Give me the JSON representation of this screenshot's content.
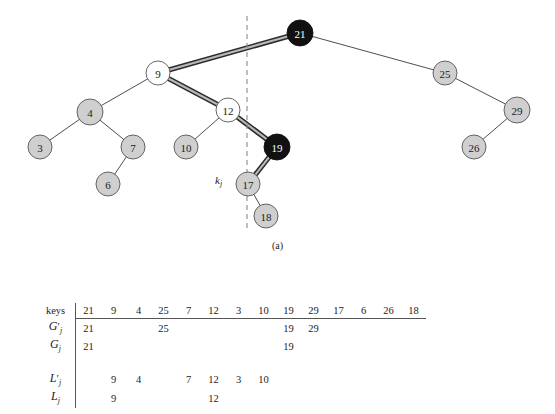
{
  "figure": {
    "caption": "(a)",
    "pointer_label": "k",
    "pointer_label_sub": "j",
    "colors": {
      "node_gray": "#cfcfcf",
      "node_white": "#ffffff",
      "node_black": "#111111",
      "edge": "#3a3a3a",
      "highlight": "#6e6e6e",
      "divider": "#8a8a8a"
    },
    "nodes": [
      {
        "key": "21",
        "x": 300,
        "y": 33,
        "fill": "black",
        "r": 13
      },
      {
        "key": "9",
        "x": 158,
        "y": 73,
        "fill": "white",
        "r": 12
      },
      {
        "key": "25",
        "x": 445,
        "y": 73,
        "fill": "gray",
        "r": 12
      },
      {
        "key": "4",
        "x": 90,
        "y": 112,
        "fill": "gray",
        "r": 13
      },
      {
        "key": "12",
        "x": 228,
        "y": 110,
        "fill": "white",
        "r": 12
      },
      {
        "key": "29",
        "x": 517,
        "y": 110,
        "fill": "gray",
        "r": 13
      },
      {
        "key": "3",
        "x": 40,
        "y": 147,
        "fill": "gray",
        "r": 12
      },
      {
        "key": "7",
        "x": 133,
        "y": 147,
        "fill": "gray",
        "r": 12
      },
      {
        "key": "10",
        "x": 186,
        "y": 147,
        "fill": "gray",
        "r": 12
      },
      {
        "key": "19",
        "x": 277,
        "y": 147,
        "fill": "black",
        "r": 13
      },
      {
        "key": "26",
        "x": 474,
        "y": 147,
        "fill": "gray",
        "r": 12
      },
      {
        "key": "6",
        "x": 108,
        "y": 184,
        "fill": "gray",
        "r": 12
      },
      {
        "key": "17",
        "x": 248,
        "y": 184,
        "fill": "gray",
        "r": 12
      },
      {
        "key": "18",
        "x": 266,
        "y": 216,
        "fill": "gray",
        "r": 12
      }
    ],
    "edges": [
      {
        "from": "21",
        "to": "9",
        "highlight": true
      },
      {
        "from": "21",
        "to": "25",
        "highlight": false
      },
      {
        "from": "9",
        "to": "4",
        "highlight": false
      },
      {
        "from": "9",
        "to": "12",
        "highlight": true
      },
      {
        "from": "4",
        "to": "3",
        "highlight": false
      },
      {
        "from": "4",
        "to": "7",
        "highlight": false
      },
      {
        "from": "7",
        "to": "6",
        "highlight": false
      },
      {
        "from": "12",
        "to": "10",
        "highlight": false
      },
      {
        "from": "12",
        "to": "19",
        "highlight": true
      },
      {
        "from": "19",
        "to": "17",
        "highlight": true
      },
      {
        "from": "17",
        "to": "18",
        "highlight": false
      },
      {
        "from": "25",
        "to": "29",
        "highlight": false
      },
      {
        "from": "29",
        "to": "26",
        "highlight": false
      }
    ],
    "divider": {
      "x": 247,
      "y1": 16,
      "y2": 232
    }
  },
  "table": {
    "header_label": "keys",
    "keys": [
      "21",
      "9",
      "4",
      "25",
      "7",
      "12",
      "3",
      "10",
      "19",
      "29",
      "17",
      "6",
      "26",
      "18"
    ],
    "rows": [
      {
        "label_base": "G",
        "label_prime": "′",
        "label_sub": "j",
        "values": [
          "21",
          "",
          "",
          "25",
          "",
          "",
          "",
          "",
          "19",
          "29",
          "",
          "",
          "",
          ""
        ]
      },
      {
        "label_base": "G",
        "label_prime": "",
        "label_sub": "j",
        "values": [
          "21",
          "",
          "",
          "",
          "",
          "",
          "",
          "",
          "19",
          "",
          "",
          "",
          "",
          ""
        ]
      },
      {
        "label_base": "L",
        "label_prime": "′",
        "label_sub": "j",
        "values": [
          "",
          "9",
          "4",
          "",
          "7",
          "12",
          "3",
          "10",
          "",
          "",
          "",
          "",
          "",
          ""
        ]
      },
      {
        "label_base": "L",
        "label_prime": "",
        "label_sub": "j",
        "values": [
          "",
          "9",
          "",
          "",
          "",
          "12",
          "",
          "",
          "",
          "",
          "",
          "",
          "",
          ""
        ]
      }
    ]
  }
}
